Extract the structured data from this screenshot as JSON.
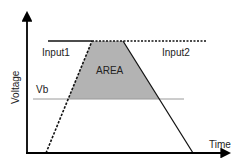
{
  "diagram": {
    "axes": {
      "y_label": "Voltage",
      "x_label": "Time"
    },
    "series": [
      {
        "name": "Input1",
        "label": "Input1",
        "line_style": "dashed",
        "shape": "rising ramp then plateau"
      },
      {
        "name": "Input2",
        "label": "Input2",
        "line_style": "solid",
        "shape": "plateau then falling ramp"
      }
    ],
    "threshold": {
      "label": "Vb"
    },
    "region": {
      "label": "AREA",
      "description": "overlap region above Vb between Input1 rise and Input2 fall"
    },
    "colors": {
      "axis": "#000000",
      "line": "#111111",
      "threshold": "#9a9a9a",
      "area_fill": "#b3b3b3",
      "text": "#222222"
    }
  }
}
